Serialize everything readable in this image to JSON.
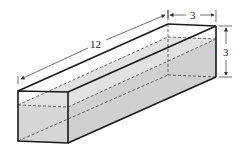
{
  "figure": {
    "dimensions": {
      "length_label": "12",
      "width_label": "3",
      "height_label": "3"
    },
    "colors": {
      "water_fill": "#d6d6d6",
      "edge": "#1a1a1a",
      "dashed": "#444444"
    }
  }
}
